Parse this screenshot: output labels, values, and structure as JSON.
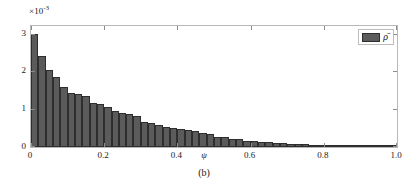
{
  "chart_data": {
    "type": "bar",
    "title": "",
    "subtitle": "",
    "caption": "(b)",
    "xlabel": "ψ",
    "ylabel": "",
    "y_multiplier_text": "×10",
    "y_multiplier_exponent": "-3",
    "y_multiplier_value": 0.001,
    "xlim": [
      0,
      1.0
    ],
    "ylim": [
      0,
      3.2
    ],
    "xticks": [
      0,
      0.2,
      0.4,
      0.6,
      0.8,
      1.0
    ],
    "xtick_labels": [
      "0",
      "0.2",
      "0.4",
      "0.6",
      "0.8",
      "1.0"
    ],
    "yticks": [
      0,
      1,
      2,
      3
    ],
    "ytick_labels": [
      "0",
      "1",
      "2",
      "3"
    ],
    "grid": false,
    "legend_position": "top-right",
    "legend": [
      {
        "name": "ρ̄",
        "color": "#5b5b5b",
        "edge_color": "#2e2e2e"
      }
    ],
    "bar_width": 0.02,
    "bar_color": "#5b5b5b",
    "bar_edge_color": "#2e2e2e",
    "series": [
      {
        "name": "ρ̄",
        "x": [
          0.01,
          0.03,
          0.05,
          0.07,
          0.09,
          0.11,
          0.13,
          0.15,
          0.17,
          0.19,
          0.21,
          0.23,
          0.25,
          0.27,
          0.29,
          0.31,
          0.33,
          0.35,
          0.37,
          0.39,
          0.41,
          0.43,
          0.45,
          0.47,
          0.49,
          0.51,
          0.53,
          0.55,
          0.57,
          0.59,
          0.61,
          0.63,
          0.65,
          0.67,
          0.69,
          0.71,
          0.73,
          0.75,
          0.77,
          0.79,
          0.81,
          0.83,
          0.85,
          0.87,
          0.89,
          0.91,
          0.93,
          0.95,
          0.97,
          0.99
        ],
        "values": [
          3.0,
          2.41,
          2.03,
          1.85,
          1.6,
          1.43,
          1.4,
          1.35,
          1.16,
          1.13,
          1.07,
          0.94,
          0.9,
          0.86,
          0.82,
          0.66,
          0.64,
          0.58,
          0.54,
          0.5,
          0.47,
          0.44,
          0.43,
          0.38,
          0.35,
          0.27,
          0.26,
          0.22,
          0.2,
          0.16,
          0.15,
          0.13,
          0.12,
          0.11,
          0.1,
          0.09,
          0.08,
          0.07,
          0.06,
          0.05,
          0.05,
          0.04,
          0.04,
          0.03,
          0.03,
          0.03,
          0.02,
          0.02,
          0.02,
          0.02
        ]
      }
    ]
  }
}
